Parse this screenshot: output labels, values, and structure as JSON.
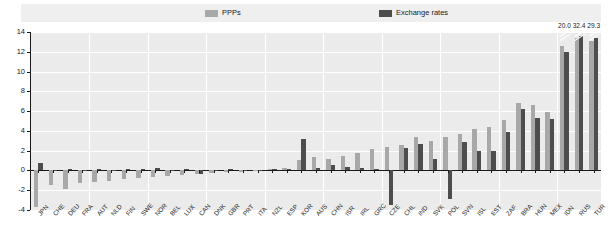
{
  "legend": {
    "items": [
      {
        "label": "PPPs",
        "color": "#a8a8a8",
        "name": "ppps"
      },
      {
        "label": "Exchange rates",
        "color": "#4d4d4d",
        "name": "exchange-rates"
      }
    ]
  },
  "yaxis": {
    "ticks": [
      "14",
      "12",
      "10",
      "8",
      "6",
      "4",
      "2",
      "0",
      "-2",
      "-4"
    ]
  },
  "chart_data": {
    "type": "bar",
    "title": "",
    "subtitle": "",
    "xlabel": "",
    "ylabel": "",
    "ylim": [
      -4,
      14
    ],
    "ytick_step": 2,
    "grid": true,
    "legend_position": "top",
    "categories": [
      "JPN",
      "CHE",
      "DEU",
      "FRA",
      "AUT",
      "NLD",
      "FIN",
      "SWE",
      "NOR",
      "BEL",
      "LUX",
      "CAN",
      "DNK",
      "GBR",
      "PRT",
      "ITA",
      "NZL",
      "ESP",
      "KOR",
      "AUS",
      "CHN",
      "ISR",
      "IRL",
      "GRC",
      "CZE",
      "CHL",
      "IND",
      "SVK",
      "POL",
      "SVN",
      "ISL",
      "EST",
      "ZAF",
      "BRA",
      "HUN",
      "MEX",
      "IDN",
      "RUS",
      "TUR"
    ],
    "series": [
      {
        "name": "PPPs",
        "color": "#a8a8a8",
        "values": [
          -3.7,
          -1.5,
          -1.9,
          -1.3,
          -1.2,
          -1.1,
          -0.9,
          -0.8,
          -0.7,
          -0.6,
          -0.5,
          -0.4,
          -0.3,
          -0.2,
          -0.2,
          -0.1,
          0.1,
          0.2,
          1.1,
          1.4,
          1.2,
          1.5,
          1.8,
          2.2,
          2.4,
          2.6,
          3.4,
          3.0,
          3.4,
          3.7,
          4.2,
          4.4,
          5.1,
          6.8,
          6.6,
          5.9,
          12.6,
          13.4,
          13.1
        ]
      },
      {
        "name": "Exchange rates",
        "color": "#4d4d4d",
        "values": [
          0.8,
          -0.1,
          0.1,
          0.0,
          0.1,
          0.0,
          0.1,
          0.1,
          0.2,
          0.0,
          0.1,
          -0.4,
          0.0,
          0.1,
          0.0,
          0.0,
          0.1,
          0.1,
          3.2,
          0.2,
          0.6,
          0.3,
          0.2,
          0.1,
          -3.5,
          2.3,
          2.7,
          1.2,
          -2.9,
          2.9,
          2.0,
          2.0,
          3.9,
          6.2,
          5.3,
          5.2,
          12.0,
          13.6,
          13.4
        ]
      }
    ],
    "truncated_bars": [
      {
        "category": "IDN",
        "label": "20.0"
      },
      {
        "category": "RUS",
        "label": "32.4"
      },
      {
        "category": "TUR",
        "label": "29.3"
      }
    ]
  }
}
